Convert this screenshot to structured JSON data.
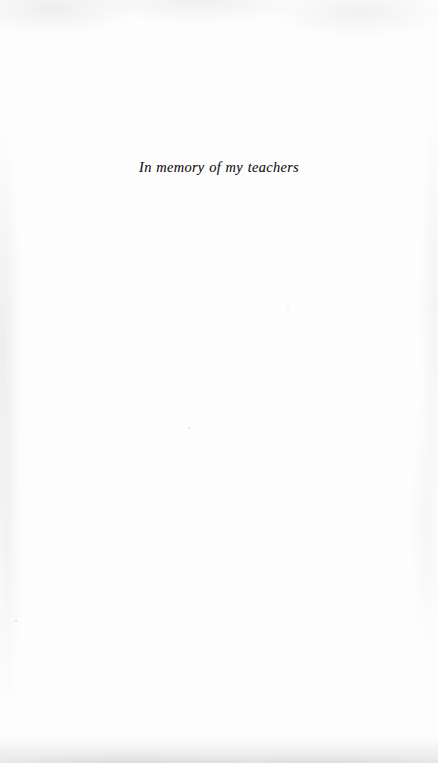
{
  "page": {
    "kind": "book-dedication-page",
    "paper_color": "#fdfdfd",
    "ink_color": "#1c1a1a"
  },
  "dedication": {
    "text": "In memory of my teachers"
  }
}
